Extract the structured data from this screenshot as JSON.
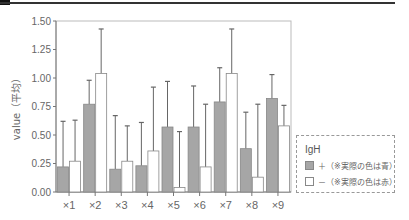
{
  "chart_data": {
    "type": "bar",
    "title": "",
    "xlabel": "",
    "ylabel": "value（平均）",
    "ylim": [
      0,
      1.5
    ],
    "yticks": [
      "0.00",
      "0.25",
      "0.50",
      "0.75",
      "1.00",
      "1.25",
      "1.50"
    ],
    "categories": [
      "×1",
      "×2",
      "×3",
      "×4",
      "×5",
      "×6",
      "×7",
      "×8",
      "×9"
    ],
    "legend_title": "IgH",
    "legend_position": "right",
    "series": [
      {
        "name": "＋（※実際の色は青）",
        "color": "#a6a6a6",
        "values": [
          0.22,
          0.77,
          0.2,
          0.23,
          0.57,
          0.57,
          0.79,
          0.38,
          0.82
        ],
        "error_upper": [
          0.62,
          0.98,
          0.67,
          0.61,
          0.97,
          0.93,
          1.09,
          0.7,
          1.03
        ]
      },
      {
        "name": "－（※実際の色は赤）",
        "color": "#ffffff",
        "values": [
          0.27,
          1.04,
          0.27,
          0.36,
          0.04,
          0.22,
          1.04,
          0.13,
          0.58
        ],
        "error_upper": [
          0.63,
          1.43,
          0.58,
          0.92,
          0.53,
          0.77,
          1.43,
          0.77,
          0.76
        ]
      }
    ]
  }
}
